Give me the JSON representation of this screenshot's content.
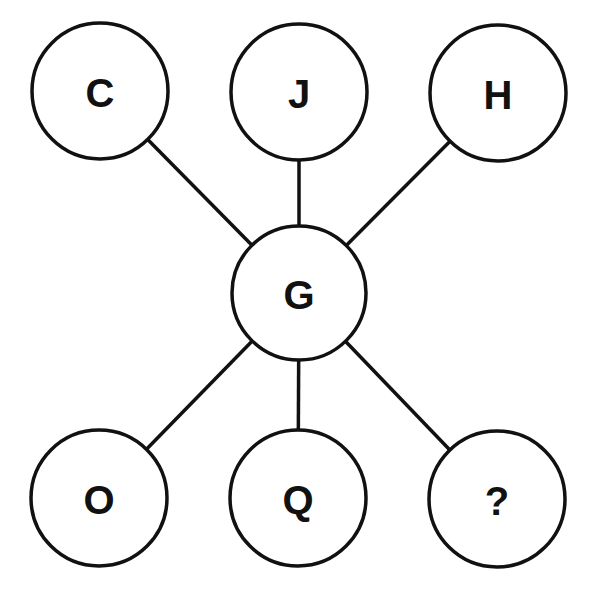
{
  "diagram": {
    "stroke_color": "#111111",
    "background": "#ffffff",
    "center_node": {
      "id": "center",
      "label": "G",
      "cx": 299,
      "cy": 293,
      "r": 67
    },
    "outer_nodes": [
      {
        "id": "top-left",
        "label": "C",
        "cx": 100,
        "cy": 91,
        "r": 68
      },
      {
        "id": "top-middle",
        "label": "J",
        "cx": 299,
        "cy": 92,
        "r": 68
      },
      {
        "id": "top-right",
        "label": "H",
        "cx": 498,
        "cy": 93,
        "r": 68
      },
      {
        "id": "bottom-left",
        "label": "O",
        "cx": 99,
        "cy": 498,
        "r": 68
      },
      {
        "id": "bottom-middle",
        "label": "Q",
        "cx": 298,
        "cy": 498,
        "r": 68
      },
      {
        "id": "bottom-right",
        "label": "?",
        "cx": 497,
        "cy": 499,
        "r": 68
      }
    ]
  }
}
